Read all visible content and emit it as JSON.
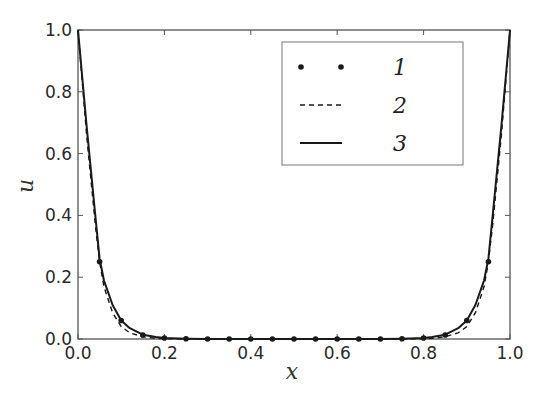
{
  "chart_data": {
    "type": "line",
    "title": "",
    "xlabel": "x",
    "ylabel": "u",
    "xlim": [
      0.0,
      1.0
    ],
    "ylim": [
      0.0,
      1.0
    ],
    "grid": false,
    "legend_position": "upper right",
    "xticks": [
      0.0,
      0.2,
      0.4,
      0.6,
      0.8,
      1.0
    ],
    "xtick_labels": [
      "0.0",
      "0.2",
      "0.4",
      "0.6",
      "0.8",
      "1.0"
    ],
    "yticks": [
      0.0,
      0.2,
      0.4,
      0.6,
      0.8,
      1.0
    ],
    "ytick_labels": [
      "0.0",
      "0.2",
      "0.4",
      "0.6",
      "0.8",
      "1.0"
    ],
    "series": [
      {
        "name": "1",
        "style": "markers",
        "x": [
          0.05,
          0.1,
          0.15,
          0.2,
          0.25,
          0.3,
          0.35,
          0.4,
          0.45,
          0.5,
          0.55,
          0.6,
          0.65,
          0.7,
          0.75,
          0.8,
          0.85,
          0.9,
          0.95
        ],
        "y": [
          0.25,
          0.06,
          0.013,
          0.003,
          0.001,
          0.0,
          0.0,
          0.0,
          0.0,
          0.0,
          0.0,
          0.0,
          0.0,
          0.0,
          0.001,
          0.003,
          0.013,
          0.06,
          0.25
        ]
      },
      {
        "name": "2",
        "style": "dashed",
        "x": [
          0.0,
          0.02,
          0.04,
          0.05,
          0.06,
          0.08,
          0.1,
          0.12,
          0.15,
          0.18,
          0.2,
          0.25,
          0.3,
          0.5,
          0.7,
          0.75,
          0.8,
          0.82,
          0.85,
          0.88,
          0.9,
          0.92,
          0.94,
          0.95,
          0.96,
          0.98,
          1.0
        ],
        "y": [
          1.0,
          0.66,
          0.37,
          0.25,
          0.17,
          0.085,
          0.04,
          0.02,
          0.007,
          0.002,
          0.001,
          0.0,
          0.0,
          0.0,
          0.0,
          0.0,
          0.001,
          0.002,
          0.007,
          0.02,
          0.04,
          0.085,
          0.17,
          0.25,
          0.37,
          0.66,
          1.0
        ]
      },
      {
        "name": "3",
        "style": "solid",
        "x": [
          0.0,
          0.02,
          0.04,
          0.05,
          0.06,
          0.08,
          0.1,
          0.12,
          0.15,
          0.18,
          0.2,
          0.25,
          0.3,
          0.5,
          0.7,
          0.75,
          0.8,
          0.82,
          0.85,
          0.88,
          0.9,
          0.92,
          0.94,
          0.95,
          0.96,
          0.98,
          1.0
        ],
        "y": [
          1.0,
          0.69,
          0.4,
          0.26,
          0.19,
          0.11,
          0.06,
          0.035,
          0.014,
          0.006,
          0.003,
          0.001,
          0.0,
          0.0,
          0.0,
          0.001,
          0.003,
          0.006,
          0.014,
          0.035,
          0.06,
          0.11,
          0.19,
          0.26,
          0.4,
          0.69,
          1.0
        ]
      }
    ],
    "legend": [
      {
        "label": "1",
        "style": "markers"
      },
      {
        "label": "2",
        "style": "dashed"
      },
      {
        "label": "3",
        "style": "solid"
      }
    ]
  },
  "colors": {
    "line": "#1a1a1a",
    "axes": "#555555",
    "legend_border": "#777777"
  }
}
